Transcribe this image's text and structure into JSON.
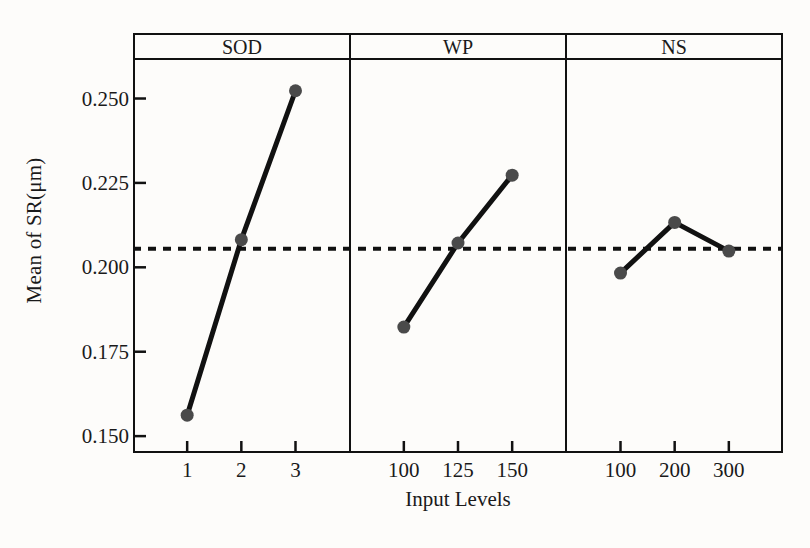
{
  "chart_data": {
    "type": "line",
    "title": "",
    "xlabel": "Input Levels",
    "ylabel": "Mean of SR(μm)",
    "ylim": [
      0.145,
      0.262
    ],
    "yticks": [
      0.15,
      0.175,
      0.2,
      0.225,
      0.25
    ],
    "ytick_labels": [
      "0.150",
      "0.175",
      "0.200",
      "0.225",
      "0.250"
    ],
    "grid": false,
    "legend": "none",
    "reference_line": {
      "value": 0.2055,
      "style": "dashed",
      "label": ""
    },
    "marker": {
      "shape": "circle",
      "color": "#4a4a4a",
      "size": 13
    },
    "line": {
      "color": "#111111",
      "width": 5
    },
    "panels": [
      {
        "name": "SOD",
        "categories": [
          "1",
          "2",
          "3"
        ],
        "values": [
          0.1562,
          0.2082,
          0.2523
        ]
      },
      {
        "name": "WP",
        "categories": [
          "100",
          "125",
          "150"
        ],
        "values": [
          0.1823,
          0.2072,
          0.2273
        ]
      },
      {
        "name": "NS",
        "categories": [
          "100",
          "200",
          "300"
        ],
        "values": [
          0.1983,
          0.2133,
          0.2048
        ]
      }
    ]
  },
  "axes": {
    "y_title": "Mean of SR(μm)",
    "x_title": "Input Levels"
  },
  "colors": {
    "frame": "#111111",
    "marker": "#4a4a4a",
    "line": "#111111",
    "background": "#fdfcfa"
  }
}
